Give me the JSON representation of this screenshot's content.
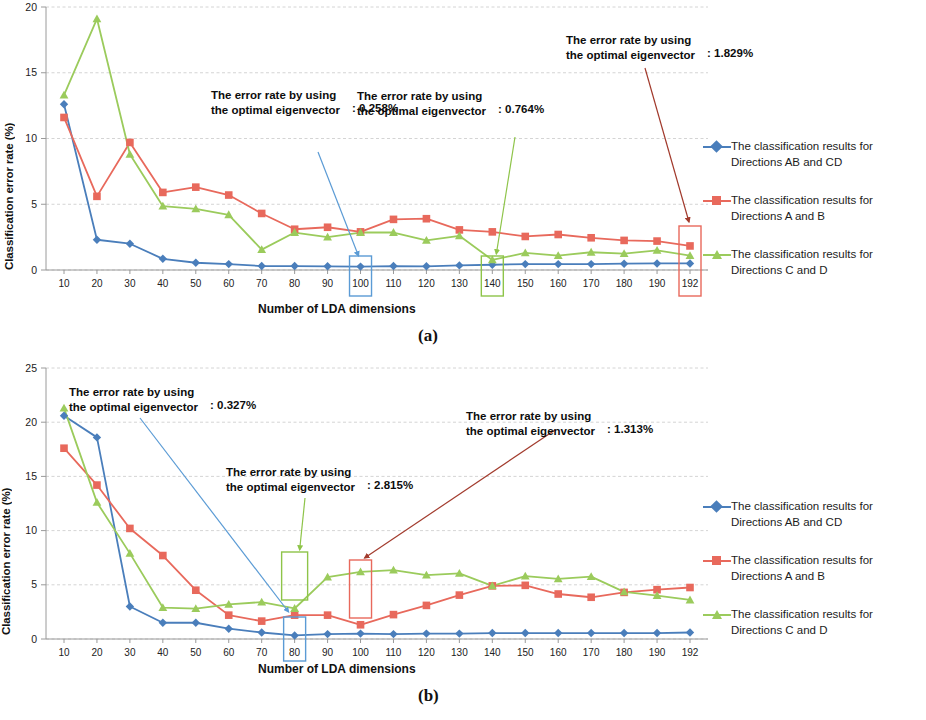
{
  "figure": {
    "colors": {
      "series_ab_cd": "#4a7ebb",
      "series_a_b": "#e8695c",
      "series_c_d": "#9bcb5c",
      "grid": "#c9c9c9",
      "axis": "#9a9a9a",
      "callout_blue": "#5b9bd5",
      "callout_green": "#8ec449",
      "callout_red": "#a23b2d",
      "box_blue": "#5b9bd5",
      "box_green": "#8ec449",
      "box_red": "#e8695c"
    },
    "legend_labels": [
      "The classification results for Directions AB and CD",
      "The classification results for Directions A and B",
      "The classification results for Directions C and D"
    ],
    "legend": [
      {
        "line1": "The classification results for",
        "line2": "Directions AB and CD",
        "icon": "line-diamond-marker-icon",
        "color": "#4a7ebb"
      },
      {
        "line1": "The classification results for",
        "line2": "Directions A and B",
        "icon": "line-square-marker-icon",
        "color": "#e8695c"
      },
      {
        "line1": "The classification results for",
        "line2": "Directions C and D",
        "icon": "line-triangle-marker-icon",
        "color": "#9bcb5c"
      }
    ],
    "panels": [
      {
        "id": "a",
        "caption": "(a)",
        "ytitle": "Classification error rate (%)",
        "xtitle": "Number of LDA dimensions",
        "yticks": [
          "0",
          "5",
          "10",
          "15",
          "20"
        ],
        "xticks": [
          "10",
          "20",
          "30",
          "40",
          "50",
          "60",
          "70",
          "80",
          "90",
          "100",
          "110",
          "120",
          "130",
          "140",
          "150",
          "160",
          "170",
          "180",
          "190",
          "192"
        ],
        "callouts": [
          {
            "line1": "The error rate by using",
            "line2": "the optimal eigenvector",
            "value": ": 0.258%",
            "color": "#5b9bd5",
            "highlight_tick": "100"
          },
          {
            "line1": "The error rate by using",
            "line2": "the optimal eigenvector",
            "value": ": 0.764%",
            "color": "#8ec449",
            "highlight_tick": "140"
          },
          {
            "line1": "The error rate by using",
            "line2": "the optimal eigenvector",
            "value": ": 1.829%",
            "color": "#a23b2d",
            "highlight_tick": "192"
          }
        ]
      },
      {
        "id": "b",
        "caption": "(b)",
        "ytitle": "Classification error rate (%)",
        "xtitle": "Number of LDA dimensions",
        "yticks": [
          "0",
          "5",
          "10",
          "15",
          "20",
          "25"
        ],
        "xticks": [
          "10",
          "20",
          "30",
          "40",
          "50",
          "60",
          "70",
          "80",
          "90",
          "100",
          "110",
          "120",
          "130",
          "140",
          "150",
          "160",
          "170",
          "180",
          "190",
          "192"
        ],
        "callouts": [
          {
            "line1": "The error rate by using",
            "line2": "the optimal eigenvector",
            "value": ": 0.327%",
            "color": "#5b9bd5",
            "highlight_tick": "80"
          },
          {
            "line1": "The error rate by using",
            "line2": "the optimal eigenvector",
            "value": ": 2.815%",
            "color": "#8ec449",
            "highlight_tick": "80"
          },
          {
            "line1": "The error rate by using",
            "line2": "the optimal eigenvector",
            "value": ": 1.313%",
            "color": "#a23b2d",
            "highlight_tick": "100"
          }
        ]
      }
    ]
  },
  "chart_data": [
    {
      "type": "line",
      "panel": "a",
      "title": "",
      "xlabel": "Number of LDA dimensions",
      "ylabel": "Classification error rate (%)",
      "categories": [
        10,
        20,
        30,
        40,
        50,
        60,
        70,
        80,
        90,
        100,
        110,
        120,
        130,
        140,
        150,
        160,
        170,
        180,
        190,
        192
      ],
      "ylim": [
        0,
        20
      ],
      "yticks": [
        0,
        5,
        10,
        15,
        20
      ],
      "grid": true,
      "legend_position": "right",
      "series": [
        {
          "name": "The classification results for Directions AB and CD",
          "color": "#4a7ebb",
          "marker": "diamond",
          "values": [
            12.6,
            2.3,
            2.0,
            0.85,
            0.55,
            0.45,
            0.3,
            0.3,
            0.28,
            0.258,
            0.3,
            0.28,
            0.35,
            0.4,
            0.45,
            0.45,
            0.45,
            0.48,
            0.5,
            0.5
          ]
        },
        {
          "name": "The classification results for Directions A and B",
          "color": "#e8695c",
          "marker": "square",
          "values": [
            11.6,
            5.6,
            9.7,
            5.9,
            6.3,
            5.7,
            4.3,
            3.1,
            3.25,
            2.9,
            3.85,
            3.9,
            3.05,
            2.9,
            2.55,
            2.7,
            2.45,
            2.25,
            2.2,
            1.829
          ]
        },
        {
          "name": "The classification results for Directions C and D",
          "color": "#9bcb5c",
          "marker": "triangle",
          "values": [
            13.3,
            19.1,
            8.8,
            4.85,
            4.65,
            4.2,
            1.55,
            2.85,
            2.5,
            2.85,
            2.85,
            2.25,
            2.6,
            0.764,
            1.3,
            1.1,
            1.35,
            1.25,
            1.5,
            1.1
          ]
        }
      ],
      "annotations": [
        {
          "text": "The error rate by using the optimal eigenvector",
          "value": ": 0.258%",
          "points_to": {
            "x": 100,
            "series": "The classification results for Directions AB and CD"
          }
        },
        {
          "text": "The error rate by using the optimal eigenvector",
          "value": ": 0.764%",
          "points_to": {
            "x": 140,
            "series": "The classification results for Directions C and D"
          }
        },
        {
          "text": "The error rate by using the optimal eigenvector",
          "value": ": 1.829%",
          "points_to": {
            "x": 192,
            "series": "The classification results for Directions A and B"
          }
        }
      ]
    },
    {
      "type": "line",
      "panel": "b",
      "title": "",
      "xlabel": "Number of LDA dimensions",
      "ylabel": "Classification error rate (%)",
      "categories": [
        10,
        20,
        30,
        40,
        50,
        60,
        70,
        80,
        90,
        100,
        110,
        120,
        130,
        140,
        150,
        160,
        170,
        180,
        190,
        192
      ],
      "ylim": [
        0,
        25
      ],
      "yticks": [
        0,
        5,
        10,
        15,
        20,
        25
      ],
      "grid": true,
      "legend_position": "right",
      "series": [
        {
          "name": "The classification results for Directions AB and CD",
          "color": "#4a7ebb",
          "marker": "diamond",
          "values": [
            20.6,
            18.6,
            3.0,
            1.5,
            1.5,
            0.95,
            0.6,
            0.327,
            0.45,
            0.5,
            0.45,
            0.5,
            0.5,
            0.55,
            0.55,
            0.55,
            0.55,
            0.55,
            0.55,
            0.6
          ]
        },
        {
          "name": "The classification results for Directions A and B",
          "color": "#e8695c",
          "marker": "square",
          "values": [
            17.6,
            14.2,
            10.2,
            7.7,
            4.5,
            2.2,
            1.65,
            2.2,
            2.2,
            1.313,
            2.25,
            3.1,
            4.05,
            4.9,
            4.95,
            4.15,
            3.85,
            4.3,
            4.55,
            4.75
          ]
        },
        {
          "name": "The classification results for Directions C and D",
          "color": "#9bcb5c",
          "marker": "triangle",
          "values": [
            21.3,
            12.6,
            7.9,
            2.9,
            2.8,
            3.2,
            3.4,
            2.815,
            5.7,
            6.2,
            6.35,
            5.9,
            6.05,
            4.9,
            5.8,
            5.55,
            5.75,
            4.35,
            4.0,
            3.6
          ]
        }
      ],
      "annotations": [
        {
          "text": "The error rate by using the optimal eigenvector",
          "value": ": 0.327%",
          "points_to": {
            "x": 80,
            "series": "The classification results for Directions AB and CD"
          }
        },
        {
          "text": "The error rate by using the optimal eigenvector",
          "value": ": 2.815%",
          "points_to": {
            "x": 80,
            "series": "The classification results for Directions C and D"
          }
        },
        {
          "text": "The error rate by using the optimal eigenvector",
          "value": ": 1.313%",
          "points_to": {
            "x": 100,
            "series": "The classification results for Directions A and B"
          }
        }
      ]
    }
  ]
}
